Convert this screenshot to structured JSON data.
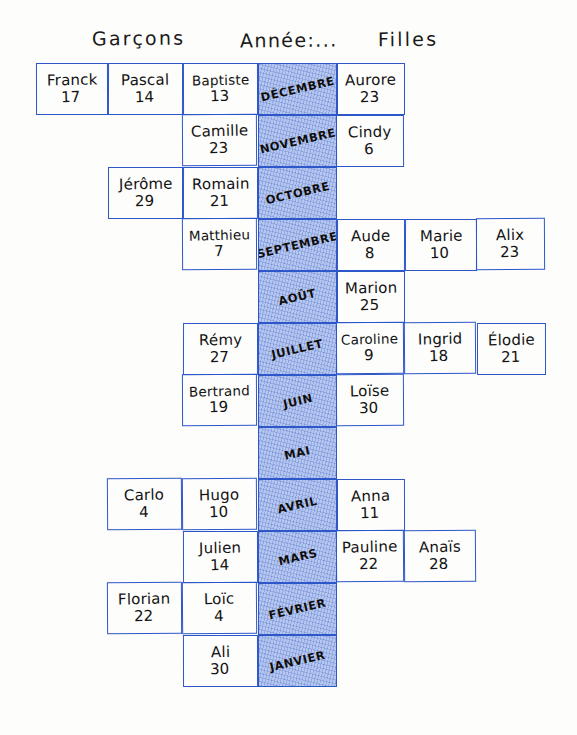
{
  "header": {
    "boys_label": "Garçons",
    "year_label": "Année:...",
    "girls_label": "Filles"
  },
  "columns": {
    "boys": [
      "boys-col-1",
      "boys-col-2",
      "boys-col-3"
    ],
    "month": "month-col",
    "girls": [
      "girls-col-1",
      "girls-col-2",
      "girls-col-3"
    ]
  },
  "rows": [
    {
      "month": "DÉCEMBRE",
      "boys": [
        {
          "name": "Franck",
          "age": "17",
          "col": 1
        },
        {
          "name": "Pascal",
          "age": "14",
          "col": 2
        },
        {
          "name": "Baptiste",
          "age": "13",
          "col": 3
        }
      ],
      "girls": [
        {
          "name": "Aurore",
          "age": "23",
          "col": 1
        }
      ]
    },
    {
      "month": "NOVEMBRE",
      "boys": [
        {
          "name": "Camille",
          "age": "23",
          "col": 3
        }
      ],
      "girls": [
        {
          "name": "Cindy",
          "age": "6",
          "col": 1
        }
      ]
    },
    {
      "month": "OCTOBRE",
      "boys": [
        {
          "name": "Jérôme",
          "age": "29",
          "col": 2
        },
        {
          "name": "Romain",
          "age": "21",
          "col": 3
        }
      ],
      "girls": []
    },
    {
      "month": "SEPTEMBRE",
      "boys": [
        {
          "name": "Matthieu",
          "age": "7",
          "col": 3
        }
      ],
      "girls": [
        {
          "name": "Aude",
          "age": "8",
          "col": 1
        },
        {
          "name": "Marie",
          "age": "10",
          "col": 2
        },
        {
          "name": "Alix",
          "age": "23",
          "col": 3
        }
      ]
    },
    {
      "month": "AOÛT",
      "boys": [],
      "girls": [
        {
          "name": "Marion",
          "age": "25",
          "col": 1
        }
      ]
    },
    {
      "month": "JUILLET",
      "boys": [
        {
          "name": "Rémy",
          "age": "27",
          "col": 3
        }
      ],
      "girls": [
        {
          "name": "Caroline",
          "age": "9",
          "col": 1
        },
        {
          "name": "Ingrid",
          "age": "18",
          "col": 2
        },
        {
          "name": "Élodie",
          "age": "21",
          "col": 3
        }
      ]
    },
    {
      "month": "JUIN",
      "boys": [
        {
          "name": "Bertrand",
          "age": "19",
          "col": 3
        }
      ],
      "girls": [
        {
          "name": "Loïse",
          "age": "30",
          "col": 1
        }
      ]
    },
    {
      "month": "MAI",
      "boys": [],
      "girls": []
    },
    {
      "month": "AVRIL",
      "boys": [
        {
          "name": "Carlo",
          "age": "4",
          "col": 2
        },
        {
          "name": "Hugo",
          "age": "10",
          "col": 3
        }
      ],
      "girls": [
        {
          "name": "Anna",
          "age": "11",
          "col": 1
        }
      ]
    },
    {
      "month": "MARS",
      "boys": [
        {
          "name": "Julien",
          "age": "14",
          "col": 3
        }
      ],
      "girls": [
        {
          "name": "Pauline",
          "age": "22",
          "col": 1
        },
        {
          "name": "Anaïs",
          "age": "28",
          "col": 2
        }
      ]
    },
    {
      "month": "FÉVRIER",
      "boys": [
        {
          "name": "Florian",
          "age": "22",
          "col": 2
        },
        {
          "name": "Loïc",
          "age": "4",
          "col": 3
        }
      ],
      "girls": []
    },
    {
      "month": "JANVIER",
      "boys": [
        {
          "name": "Ali",
          "age": "30",
          "col": 3
        }
      ],
      "girls": []
    }
  ],
  "geometry": {
    "boys_col_x": [
      36,
      108,
      183
    ],
    "boys_col_w": [
      72,
      75,
      75
    ],
    "month_x": 258,
    "month_w": 79,
    "girls_col_x": [
      337,
      405,
      477
    ],
    "girls_col_w": [
      68,
      72,
      69
    ],
    "row_top": 63,
    "row_h": 52
  },
  "colors": {
    "ink_grid": "#2d56c8",
    "ink_text": "#131313",
    "month_wash": "#688ce1",
    "paper": "#fdfdfc"
  }
}
